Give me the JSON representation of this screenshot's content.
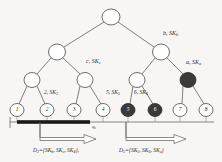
{
  "figure": {
    "type": "binary-key-tree",
    "background_color": "#f7f6f4",
    "line_color": "#4a4a4a",
    "node_fill_white": "#ffffff",
    "node_fill_dark": "#3a3a3a",
    "bar_color": "#1a1a1a"
  },
  "tree": {
    "levels": 4,
    "nodes": [
      {
        "id": "root",
        "label": "",
        "x": 111,
        "y": 17,
        "rx": 9,
        "ry": 8,
        "fill": "white"
      },
      {
        "id": "L1a",
        "label": "",
        "x": 57,
        "y": 52,
        "rx": 8.5,
        "ry": 8,
        "fill": "white"
      },
      {
        "id": "L1b",
        "label": "b",
        "x": 161,
        "y": 52,
        "rx": 8.5,
        "ry": 8,
        "fill": "white"
      },
      {
        "id": "L2a",
        "label": "",
        "x": 32,
        "y": 80,
        "rx": 8,
        "ry": 7.5,
        "fill": "white"
      },
      {
        "id": "L2b",
        "label": "c",
        "x": 85,
        "y": 80,
        "rx": 8,
        "ry": 7.5,
        "fill": "white"
      },
      {
        "id": "L2c",
        "label": "",
        "x": 137,
        "y": 80,
        "rx": 8,
        "ry": 7.5,
        "fill": "white"
      },
      {
        "id": "L2d",
        "label": "a",
        "x": 188,
        "y": 80,
        "rx": 8,
        "ry": 7.5,
        "fill": "dark"
      },
      {
        "id": "leaf1",
        "label": "1",
        "x": 17,
        "y": 110,
        "rx": 7,
        "ry": 6.5,
        "fill": "white"
      },
      {
        "id": "leaf2",
        "label": "2",
        "x": 47,
        "y": 110,
        "rx": 7,
        "ry": 6.5,
        "fill": "white"
      },
      {
        "id": "leaf3",
        "label": "3",
        "x": 74,
        "y": 110,
        "rx": 7,
        "ry": 6.5,
        "fill": "white"
      },
      {
        "id": "leaf4",
        "label": "4",
        "x": 103,
        "y": 110,
        "rx": 7,
        "ry": 6.5,
        "fill": "white"
      },
      {
        "id": "leaf5",
        "label": "5",
        "x": 128,
        "y": 110,
        "rx": 7,
        "ry": 6.5,
        "fill": "dark"
      },
      {
        "id": "leaf6",
        "label": "6",
        "x": 155,
        "y": 110,
        "rx": 7,
        "ry": 6.5,
        "fill": "dark"
      },
      {
        "id": "leaf7",
        "label": "7",
        "x": 180,
        "y": 110,
        "rx": 7,
        "ry": 6.5,
        "fill": "white"
      },
      {
        "id": "leaf8",
        "label": "8",
        "x": 206,
        "y": 110,
        "rx": 7,
        "ry": 6.5,
        "fill": "white"
      }
    ],
    "leaf_numbers": [
      "1",
      "2",
      "3",
      "4",
      "5",
      "6",
      "7",
      "8"
    ],
    "revoked_leaves": [
      "5",
      "6"
    ],
    "revoked_internal": [
      "a"
    ]
  },
  "annotations": {
    "node_b": {
      "text": "b, SK",
      "sub": "b",
      "x": 163,
      "y": 33
    },
    "node_a": {
      "text": "a, SK",
      "sub": "a",
      "x": 187,
      "y": 62
    },
    "node_c": {
      "text": "c, SK",
      "sub": "c",
      "x": 86,
      "y": 61
    },
    "leaf_2": {
      "text": "2, SK",
      "sub": "2",
      "x": 49,
      "y": 93
    },
    "leaf_5": {
      "text": "5, SK",
      "sub": "5",
      "x": 109,
      "y": 93
    },
    "leaf_6": {
      "text": "6, SK",
      "sub": "6",
      "x": 136,
      "y": 93
    },
    "q_marker": {
      "text": "q",
      "sub": "s",
      "x": 93,
      "y": 124
    }
  },
  "axis": {
    "line_y": 122,
    "line_x_start": 10,
    "line_x_end": 214,
    "thick_bar": {
      "x_start": 17,
      "x_end": 90,
      "y": 122,
      "thickness": 3.5
    },
    "tick_positions": [
      17,
      47,
      74,
      103,
      128,
      155,
      180,
      206
    ]
  },
  "arrows": [
    {
      "id": "arrow-d2",
      "x_start": 40,
      "x_end": 96,
      "y": 134,
      "label": "D",
      "label_sub": "2",
      "label_eq": "={SK",
      "set": [
        "SK b",
        "SK c",
        "SK 4"
      ],
      "full_text": "D2={SKb, SKc, SK4},",
      "label_x": 34,
      "label_y": 150
    },
    {
      "id": "arrow-d5",
      "x_start": 126,
      "x_end": 186,
      "y": 134,
      "label": "D",
      "label_sub": "5",
      "label_eq": "={SK",
      "set": [
        "SK 5",
        "SK 6",
        "SK a"
      ],
      "full_text": "D5={SK5, SK6, SKa}",
      "label_x": 120,
      "label_y": 150
    }
  ],
  "set_labels": {
    "d2": {
      "D": "D",
      "d_sub": "2",
      "open": "={",
      "items": [
        {
          "base": "SK",
          "sub": "b"
        },
        {
          "base": "SK",
          "sub": "c"
        },
        {
          "base": "SK",
          "sub": "4"
        }
      ],
      "close": "},"
    },
    "d5": {
      "D": "D",
      "d_sub": "5",
      "open": "={",
      "items": [
        {
          "base": "SK",
          "sub": "5"
        },
        {
          "base": "SK",
          "sub": "6"
        },
        {
          "base": "SK",
          "sub": "a"
        }
      ],
      "close": "}"
    }
  }
}
